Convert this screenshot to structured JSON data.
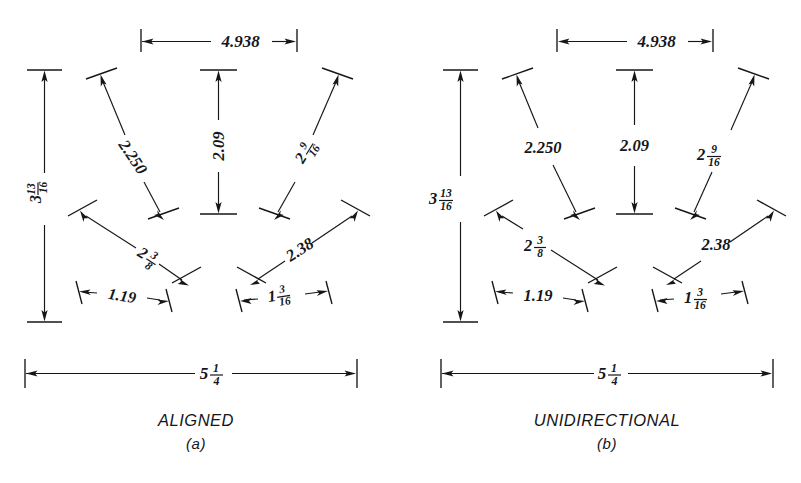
{
  "figure": {
    "background_color": "#ffffff",
    "ink_color": "#16161a",
    "width": 801,
    "height": 483
  },
  "panels": [
    {
      "id": "a",
      "caption": "ALIGNED",
      "subcaption": "(a)",
      "text_orientation": "aligned-with-dimension-line",
      "dimensions": [
        {
          "key": "top_horizontal",
          "label": "4.938",
          "whole": "4.938",
          "num": "",
          "den": "",
          "type": "decimal",
          "rotation": 0
        },
        {
          "key": "left_vertical",
          "label": "3 13/16",
          "whole": "3",
          "num": "13",
          "den": "16",
          "type": "fraction",
          "rotation": -90
        },
        {
          "key": "center_vertical",
          "label": "2.09",
          "whole": "2.09",
          "num": "",
          "den": "",
          "type": "decimal",
          "rotation": -90
        },
        {
          "key": "upper_left_diagonal",
          "label": "2.250",
          "whole": "2.250",
          "num": "",
          "den": "",
          "type": "decimal",
          "rotation": 56
        },
        {
          "key": "upper_right_diagonal",
          "label": "2 9/16",
          "whole": "2",
          "num": "9",
          "den": "16",
          "type": "fraction",
          "rotation": -58
        },
        {
          "key": "lower_left_diagonal",
          "label": "2 3/8",
          "whole": "2",
          "num": "3",
          "den": "8",
          "type": "fraction",
          "rotation": 33
        },
        {
          "key": "lower_right_diagonal",
          "label": "2.38",
          "whole": "2.38",
          "num": "",
          "den": "",
          "type": "decimal",
          "rotation": -33
        },
        {
          "key": "small_left_horizontal",
          "label": "1.19",
          "whole": "1.19",
          "num": "",
          "den": "",
          "type": "decimal",
          "rotation": 14
        },
        {
          "key": "small_right_horizontal",
          "label": "1 3/16",
          "whole": "1",
          "num": "3",
          "den": "16",
          "type": "fraction",
          "rotation": -14
        },
        {
          "key": "bottom_overall",
          "label": "5 1/4",
          "whole": "5",
          "num": "1",
          "den": "4",
          "type": "fraction",
          "rotation": 0
        }
      ]
    },
    {
      "id": "b",
      "caption": "UNIDIRECTIONAL",
      "subcaption": "(b)",
      "text_orientation": "all-horizontal",
      "dimensions": [
        {
          "key": "top_horizontal",
          "label": "4.938",
          "whole": "4.938",
          "num": "",
          "den": "",
          "type": "decimal",
          "rotation": 0
        },
        {
          "key": "left_vertical",
          "label": "3 13/16",
          "whole": "3",
          "num": "13",
          "den": "16",
          "type": "fraction",
          "rotation": 0
        },
        {
          "key": "center_vertical",
          "label": "2.09",
          "whole": "2.09",
          "num": "",
          "den": "",
          "type": "decimal",
          "rotation": 0
        },
        {
          "key": "upper_left_diagonal",
          "label": "2.250",
          "whole": "2.250",
          "num": "",
          "den": "",
          "type": "decimal",
          "rotation": 0
        },
        {
          "key": "upper_right_diagonal",
          "label": "2 9/16",
          "whole": "2",
          "num": "9",
          "den": "16",
          "type": "fraction",
          "rotation": 0
        },
        {
          "key": "lower_left_diagonal",
          "label": "2 3/8",
          "whole": "2",
          "num": "3",
          "den": "8",
          "type": "fraction",
          "rotation": 0
        },
        {
          "key": "lower_right_diagonal",
          "label": "2.38",
          "whole": "2.38",
          "num": "",
          "den": "",
          "type": "decimal",
          "rotation": 0
        },
        {
          "key": "small_left_horizontal",
          "label": "1.19",
          "whole": "1.19",
          "num": "",
          "den": "",
          "type": "decimal",
          "rotation": 0
        },
        {
          "key": "small_right_horizontal",
          "label": "1 3/16",
          "whole": "1",
          "num": "3",
          "den": "16",
          "type": "fraction",
          "rotation": 0
        },
        {
          "key": "bottom_overall",
          "label": "5 1/4",
          "whole": "5",
          "num": "1",
          "den": "4",
          "type": "fraction",
          "rotation": 0
        }
      ]
    }
  ]
}
